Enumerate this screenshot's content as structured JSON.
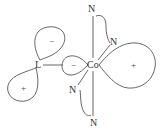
{
  "diagram": {
    "type": "orbital-overlap",
    "stroke_color": "#555555",
    "labels": {
      "ligand": "L",
      "metal": "Co",
      "n_top": "N",
      "n_upper_right": "N",
      "n_lower_left": "N",
      "n_bottom": "N"
    },
    "lobes": {
      "ligand_upper": "−",
      "ligand_lower": "+",
      "metal_left": "−",
      "metal_right": "+"
    }
  }
}
